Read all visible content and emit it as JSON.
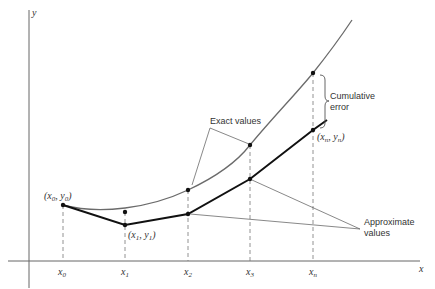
{
  "axes": {
    "x_label": "x",
    "y_label": "y"
  },
  "ticks": [
    {
      "base": "x",
      "sub": "0"
    },
    {
      "base": "x",
      "sub": "1"
    },
    {
      "base": "x",
      "sub": "2"
    },
    {
      "base": "x",
      "sub": "3"
    },
    {
      "base": "x",
      "sub": "n"
    }
  ],
  "point_labels": {
    "p0": {
      "x": "x",
      "xs": "0",
      "y": "y",
      "ys": "0"
    },
    "p1": {
      "x": "x",
      "xs": "1",
      "y": "y",
      "ys": "1"
    },
    "pn": {
      "x": "x",
      "xs": "n",
      "y": "y",
      "ys": "n"
    }
  },
  "annotations": {
    "exact": "Exact values",
    "approx_line1": "Approximate",
    "approx_line2": "values",
    "error_line1": "Cumulative",
    "error_line2": "error"
  },
  "colors": {
    "exact_curve": "#6b6b6b",
    "approx_line": "#111111",
    "axis": "#555555"
  }
}
